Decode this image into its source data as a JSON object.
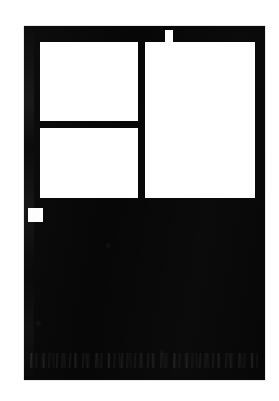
{
  "document": {
    "title": "Scanned Page Layout Plate",
    "page_background": "#ffffff",
    "ink_color": "#070707",
    "panel_color": "#ffffff",
    "width_px": 279,
    "height_px": 401
  },
  "plate": {
    "name": "ink-plate",
    "x": 24,
    "y": 26,
    "width": 241,
    "height": 354,
    "label": ""
  },
  "panels": [
    {
      "id": "panel-top-left",
      "label": "",
      "x": 40,
      "y": 42,
      "width": 98,
      "height": 79
    },
    {
      "id": "panel-bottom-left",
      "label": "",
      "x": 40,
      "y": 128,
      "width": 98,
      "height": 70
    },
    {
      "id": "panel-right",
      "label": "",
      "x": 145,
      "y": 42,
      "width": 110,
      "height": 156
    }
  ],
  "markers": {
    "header_tab": {
      "id": "header-tab",
      "label": "",
      "x": 165,
      "y": 30,
      "width": 8,
      "height": 13
    },
    "corner_square": {
      "id": "corner-marker",
      "label": "",
      "x": 28,
      "y": 208,
      "width": 15,
      "height": 14
    }
  },
  "artifacts": {
    "scan_band_left": {
      "x": 24,
      "y": 26,
      "width": 10,
      "height": 354
    },
    "noise_streak": {
      "x": 30,
      "y": 353,
      "width": 228,
      "height": 15
    }
  }
}
